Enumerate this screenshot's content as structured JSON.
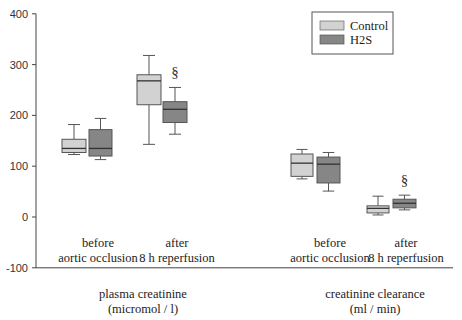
{
  "chart_data": {
    "type": "box",
    "title": "",
    "ylabel": "",
    "ylim": [
      -100,
      400
    ],
    "yticks": [
      -100,
      0,
      100,
      200,
      300,
      400
    ],
    "legend": {
      "position": "top-right",
      "entries": [
        {
          "name": "Control",
          "color": "#d2d2d2"
        },
        {
          "name": "H2S",
          "color": "#868686"
        }
      ]
    },
    "groups": [
      {
        "label_line1": "plasma creatinine",
        "label_line2": "(micromol / l)",
        "timepoints": [
          {
            "label_line1": "before",
            "label_line2": "aortic occlusion",
            "boxes": [
              {
                "series": "Control",
                "whisker_low": 123,
                "q1": 127,
                "median": 135,
                "q3": 153,
                "whisker_high": 182,
                "significant": false
              },
              {
                "series": "H2S",
                "whisker_low": 113,
                "q1": 120,
                "median": 135,
                "q3": 172,
                "whisker_high": 194,
                "significant": false
              }
            ]
          },
          {
            "label_line1": "after",
            "label_line2": "8 h reperfusion",
            "boxes": [
              {
                "series": "Control",
                "whisker_low": 143,
                "q1": 221,
                "median": 268,
                "q3": 280,
                "whisker_high": 318,
                "significant": false
              },
              {
                "series": "H2S",
                "whisker_low": 163,
                "q1": 186,
                "median": 212,
                "q3": 227,
                "whisker_high": 255,
                "significant": true
              }
            ]
          }
        ]
      },
      {
        "label_line1": "creatinine clearance",
        "label_line2": "(ml / min)",
        "timepoints": [
          {
            "label_line1": "before",
            "label_line2": "aortic occlusion",
            "boxes": [
              {
                "series": "Control",
                "whisker_low": 75,
                "q1": 80,
                "median": 106,
                "q3": 124,
                "whisker_high": 133,
                "significant": false
              },
              {
                "series": "H2S",
                "whisker_low": 51,
                "q1": 67,
                "median": 104,
                "q3": 118,
                "whisker_high": 127,
                "significant": false
              }
            ]
          },
          {
            "label_line1": "after",
            "label_line2": "8 h reperfusion",
            "boxes": [
              {
                "series": "Control",
                "whisker_low": 4,
                "q1": 8,
                "median": 17,
                "q3": 22,
                "whisker_high": 41,
                "significant": false
              },
              {
                "series": "H2S",
                "whisker_low": 14,
                "q1": 18,
                "median": 27,
                "q3": 35,
                "whisker_high": 43,
                "significant": true
              }
            ]
          }
        ]
      }
    ],
    "significance_marker": "§"
  },
  "layout": {
    "plot_left": 36,
    "plot_right": 453,
    "y_zero_px": 217,
    "px_per_unit": 0.508,
    "box_x": [
      [
        [
          62,
          86
        ],
        [
          89,
          112
        ]
      ],
      [
        [
          137,
          161
        ],
        [
          163,
          187
        ]
      ],
      [
        [
          291,
          313
        ],
        [
          317,
          340
        ]
      ],
      [
        [
          367,
          389
        ],
        [
          393,
          416
        ]
      ]
    ],
    "timepoint_label_centers": [
      98,
      177,
      330,
      406
    ],
    "group_label_centers": [
      143,
      375
    ]
  }
}
